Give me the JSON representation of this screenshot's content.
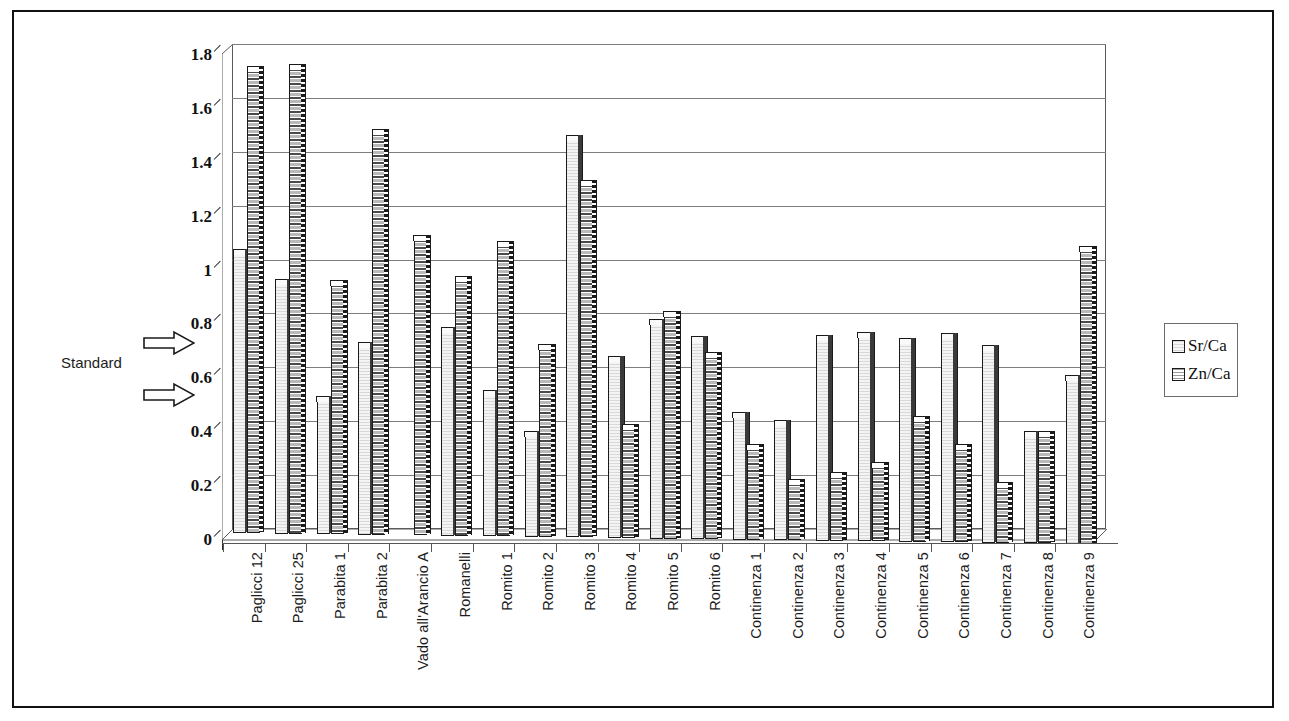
{
  "annotation": {
    "standard_label": "Standard",
    "arrow_sr_icon": "arrow-right-icon",
    "arrow_zn_icon": "arrow-right-icon"
  },
  "legend": {
    "position": "right",
    "entries": [
      {
        "label": "Sr/Ca",
        "swatch": "sr-pattern-swatch"
      },
      {
        "label": "Zn/Ca",
        "swatch": "zn-pattern-swatch"
      }
    ]
  },
  "chart_data": {
    "type": "bar",
    "title": "",
    "subtitle": "",
    "xlabel": "",
    "ylabel": "",
    "ylim": [
      0,
      1.8
    ],
    "ytick_step": 0.2,
    "yticks": [
      "0",
      "0.2",
      "0.4",
      "0.6",
      "0.8",
      "1",
      "1.2",
      "1.4",
      "1.6",
      "1.8"
    ],
    "grid": true,
    "grid_axis": "y",
    "legend_position": "right",
    "style": "3d-clustered-column",
    "categories": [
      "Paglicci 12",
      "Paglicci 25",
      "Parabita 1",
      "Parabita 2",
      "Vado all'Arancio A",
      "Romanelli",
      "Romito 1",
      "Romito 2",
      "Romito 3",
      "Romito 4",
      "Romito 5",
      "Romito 6",
      "Continenza 1",
      "Continenza 2",
      "Continenza 3",
      "Continenza 4",
      "Continenza 5",
      "Continenza 6",
      "Continenza 7",
      "Continenza 8",
      "Continenza 9"
    ],
    "series": [
      {
        "name": "Sr/Ca",
        "values": [
          1.04,
          0.93,
          0.5,
          0.7,
          null,
          0.76,
          0.53,
          0.38,
          1.48,
          0.66,
          0.8,
          0.74,
          0.46,
          0.43,
          0.75,
          0.76,
          0.74,
          0.76,
          0.72,
          0.4,
          0.61
        ]
      },
      {
        "name": "Zn/Ca",
        "values": [
          1.72,
          1.73,
          0.93,
          1.49,
          1.1,
          0.95,
          1.08,
          0.7,
          1.31,
          0.41,
          0.83,
          0.68,
          0.34,
          0.21,
          0.24,
          0.28,
          0.45,
          0.35,
          0.21,
          0.4,
          1.09
        ]
      }
    ],
    "standard_lines": {
      "sr_ca": 0.72,
      "zn_ca": 0.55
    }
  }
}
